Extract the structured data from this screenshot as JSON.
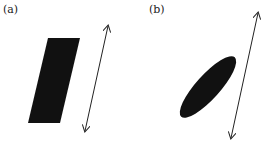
{
  "panels": [
    {
      "label": "(a)",
      "shape": "parallelogram",
      "fill": "#111111",
      "points": "48,38 80,38 60,123 28,123",
      "arrow": {
        "x1": 85,
        "y1": 131,
        "x2": 108,
        "y2": 26,
        "style": "double-headed"
      }
    },
    {
      "label": "(b)",
      "shape": "ellipse",
      "fill": "#111111",
      "ellipse": {
        "cx": 208,
        "cy": 87,
        "rx": 40,
        "ry": 12,
        "rotate": -48
      },
      "arrow": {
        "x1": 231,
        "y1": 138,
        "x2": 258,
        "y2": 13,
        "style": "double-headed"
      }
    }
  ],
  "colors": {
    "stroke": "#222222",
    "fill": "#111111",
    "background": "#ffffff"
  }
}
